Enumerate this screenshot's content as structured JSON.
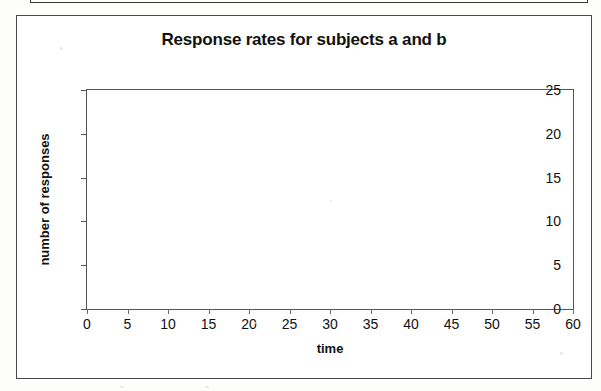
{
  "page": {
    "background_color": "#fdfdfc",
    "border_color": "#4a4a4a"
  },
  "upper_frame": {
    "description": "partial bottom edge of a preceding boxed figure"
  },
  "chart_data": {
    "type": "line",
    "title": "Response rates for subjects a and b",
    "xlabel": "time",
    "ylabel": "number of responses",
    "xlim": [
      0,
      60
    ],
    "ylim": [
      0,
      25
    ],
    "xticks": [
      0,
      5,
      10,
      15,
      20,
      25,
      30,
      35,
      40,
      45,
      50,
      55,
      60
    ],
    "yticks": [
      0,
      5,
      10,
      15,
      20,
      25
    ],
    "xtick_labels": [
      "0",
      "5",
      "10",
      "15",
      "20",
      "25",
      "30",
      "35",
      "40",
      "45",
      "50",
      "55",
      "60"
    ],
    "ytick_labels": [
      "0",
      "5",
      "10",
      "15",
      "20",
      "25"
    ],
    "grid": false,
    "legend": null,
    "series": [],
    "annotations": [],
    "note": "Blank plotting grid - no data plotted; axes frame only"
  }
}
